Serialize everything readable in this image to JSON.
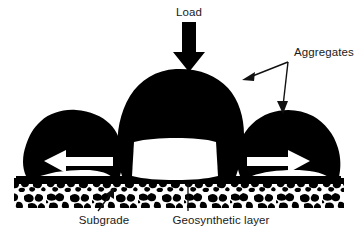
{
  "figure": {
    "background_color": "#ffffff",
    "ink_color": "#000000",
    "width": 358,
    "height": 244
  },
  "labels": {
    "load": "Load",
    "aggregates": "Aggregates",
    "subgrade": "Subgrade",
    "geosynthetic": "Geosynthetic layer"
  },
  "elements": {
    "load_arrow": {
      "name": "load-arrow",
      "direction": "down",
      "color": "#000000"
    },
    "left_restraint_arrow": {
      "name": "left-lateral-restraint-arrow",
      "direction": "left",
      "color": "#ffffff"
    },
    "right_restraint_arrow": {
      "name": "right-lateral-restraint-arrow",
      "direction": "right",
      "color": "#ffffff"
    },
    "aggregates_leader": {
      "name": "aggregates-leader-lines",
      "targets": [
        "center-aggregate-right-shoulder",
        "right-aggregate-top"
      ],
      "color": "#111111"
    },
    "subgrade_leader": {
      "name": "subgrade-leader-line",
      "direction": "up-right",
      "color": "#111111"
    },
    "geosynthetic_leader": {
      "name": "geosynthetic-leader-line",
      "direction": "up",
      "color": "#111111"
    },
    "geosynthetic_layer_band": {
      "name": "geosynthetic-layer-band",
      "color": "#000000"
    },
    "subgrade_texture": {
      "name": "subgrade-texture",
      "pattern": "mottled-speckle",
      "color": "#000000"
    },
    "aggregates_shapes": {
      "name": "aggregate-silhouettes",
      "count": 3,
      "color": "#000000"
    }
  }
}
